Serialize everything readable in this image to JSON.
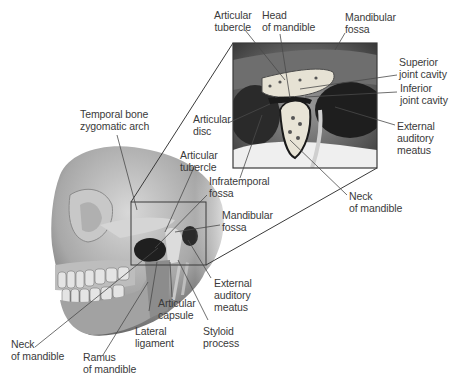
{
  "inset_labels": {
    "articular_tubercle": "Articular\ntubercle",
    "head_of_mandible": "Head\nof mandible",
    "mandibular_fossa": "Mandibular\nfossa",
    "superior_joint_cavity": "Superior\njoint cavity",
    "inferior_joint_cavity": "Inferior\njoint cavity",
    "external_auditory_meatus": "External\nauditory\nmeatus",
    "articular_disc": "Articular\ndisc",
    "neck_of_mandible": "Neck\nof mandible"
  },
  "skull_labels": {
    "temporal_bone_zygomatic_arch": "Temporal bone\nzygomatic arch",
    "articular_tubercle": "Articular\ntubercle",
    "infratemporal_fossa": "Infratemporal\nfossa",
    "mandibular_fossa": "Mandibular\nfossa",
    "external_auditory_meatus": "External\nauditory\nmeatus",
    "articular_capsule": "Articular\ncapsule",
    "styloid_process": "Styloid\nprocess",
    "lateral_ligament": "Lateral\nligament",
    "neck_of_mandible": "Neck\nof mandible",
    "ramus_of_mandible": "Ramus\nof mandible"
  },
  "colors": {
    "line": "#3a3a3a",
    "bone_light": "#e8e4d8",
    "bone_dark": "#6a6a6a",
    "shadow": "#1a1a1a"
  }
}
